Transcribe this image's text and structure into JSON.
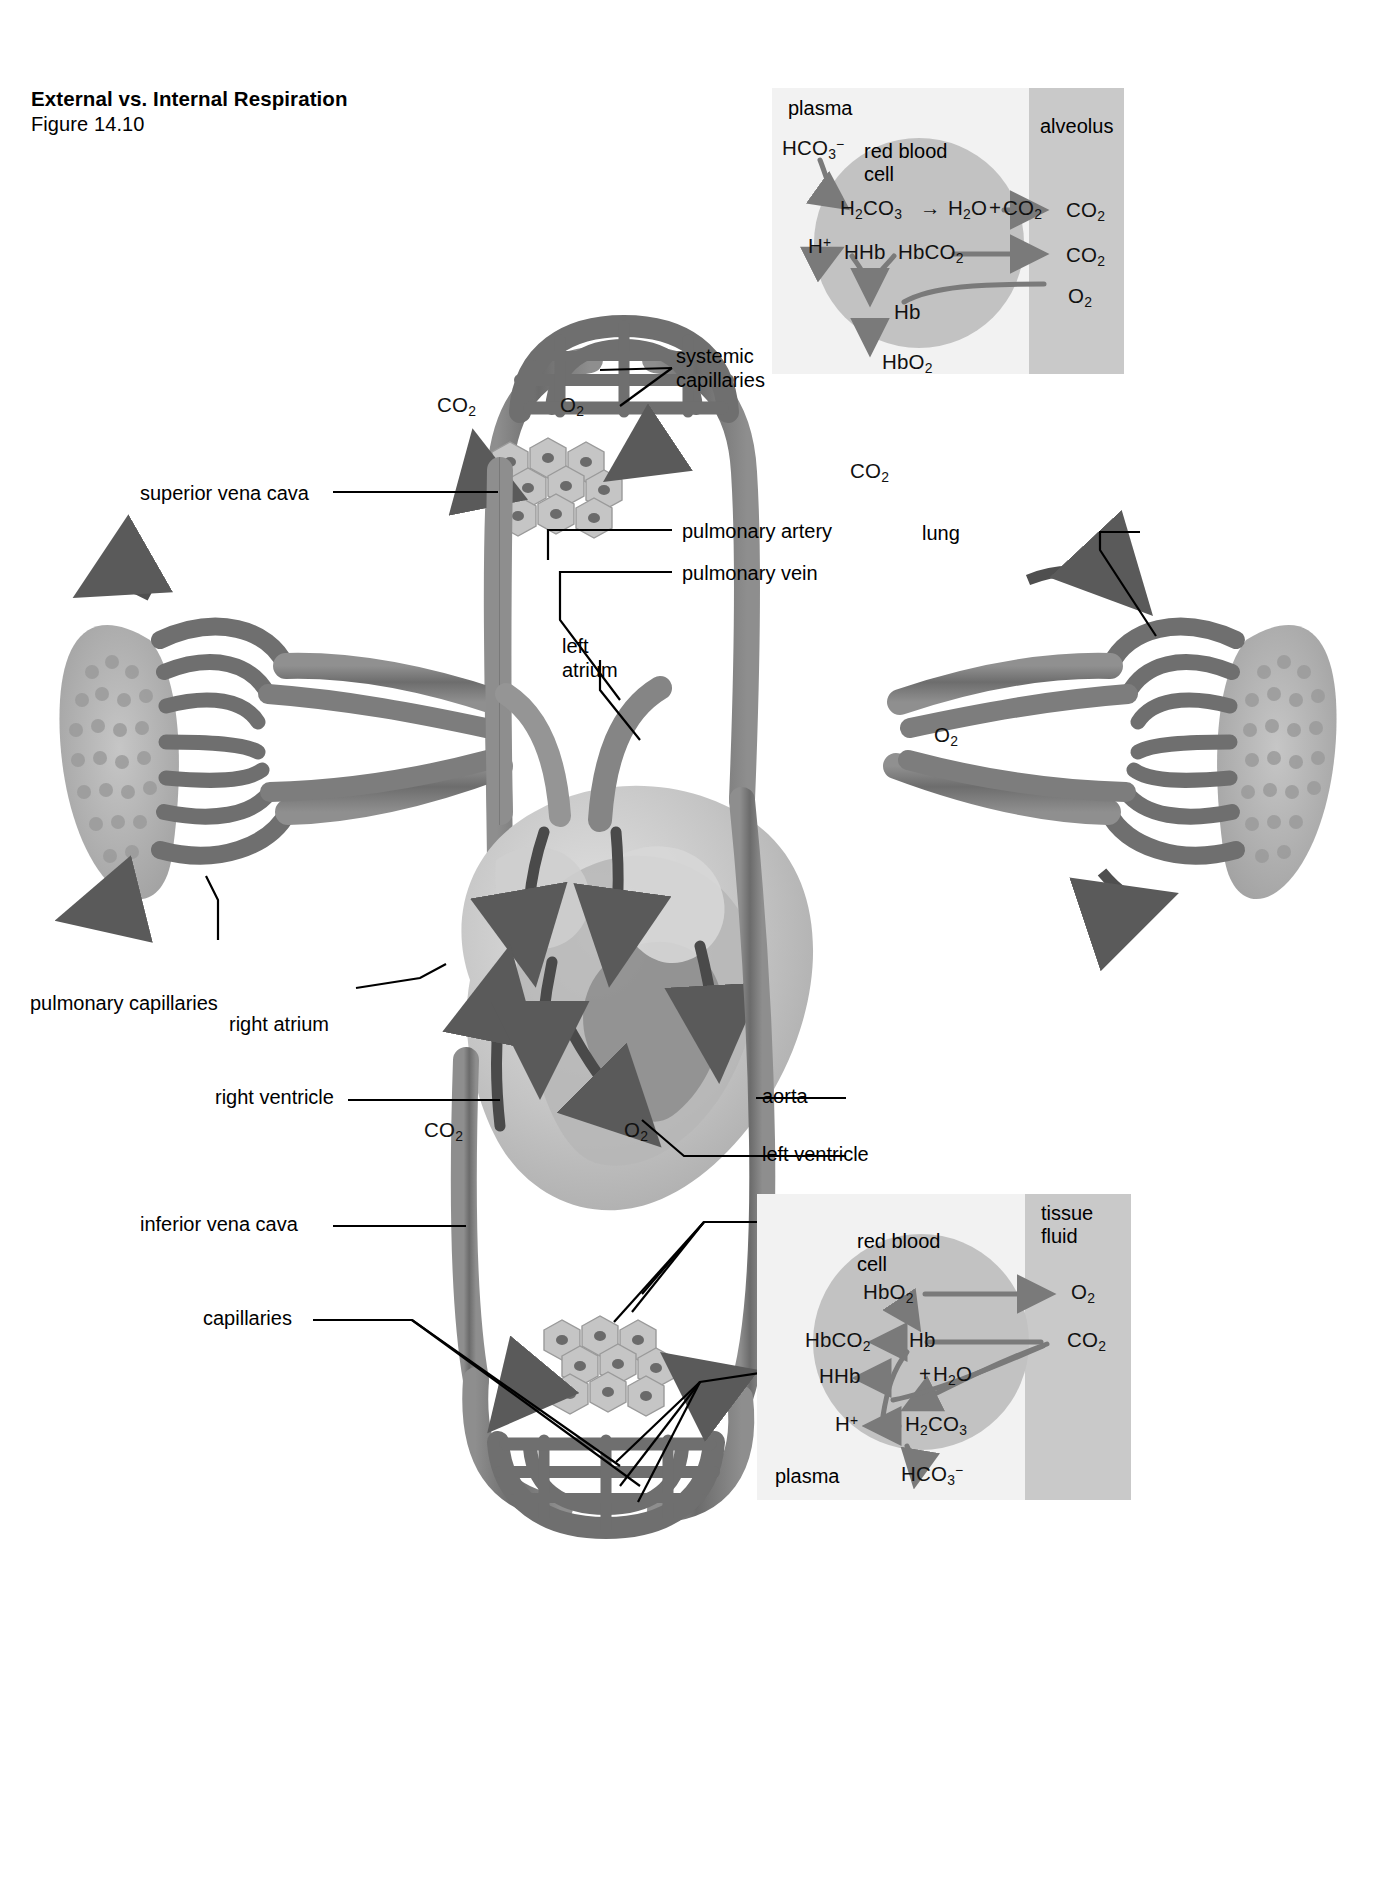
{
  "figure": {
    "title": "External vs. Internal Respiration",
    "number": "Figure 14.10"
  },
  "diagram_labels": {
    "systemic_capillaries_top": "systemic\ncapillaries",
    "systemic_capillaries_top_line1": "systemic",
    "systemic_capillaries_top_line2": "capillaries",
    "superior_vena_cava": "superior vena cava",
    "pulmonary_artery": "pulmonary artery",
    "pulmonary_vein": "pulmonary vein",
    "lung": "lung",
    "left_atrium_line1": "left",
    "left_atrium_line2": "atrium",
    "pulmonary_capillaries": "pulmonary capillaries",
    "right_atrium": "right atrium",
    "right_ventricle": "right ventricle",
    "aorta": "aorta",
    "left_ventricle": "left ventricle",
    "inferior_vena_cava": "inferior vena cava",
    "tissue_cells": "tissue cells",
    "capillaries": "capillaries",
    "systemic_capillaries_bottom_line1": "systemic",
    "systemic_capillaries_bottom_line2": "capillaries"
  },
  "gas_labels": {
    "co2_top_cells": "CO2",
    "o2_top_cells": "O2",
    "co2_right_lung": "CO2",
    "o2_right_lung": "O2",
    "co2_bottom_cells": "CO2",
    "o2_bottom_cells": "O2"
  },
  "inset_external": {
    "plasma_label": "plasma",
    "alveolus_label": "alveolus",
    "rbc_label_line1": "red blood",
    "rbc_label_line2": "cell",
    "bicarbonate": "HCO3-",
    "proton": "H+",
    "carbonic_acid": "H2CO3",
    "arrow_symbol": "→",
    "water_plus_co2": "H2O+CO2",
    "deoxyhemoglobin": "HHb",
    "carbaminohemoglobin": "HbCO2",
    "hemoglobin": "Hb",
    "oxyhemoglobin": "HbO2",
    "co2_out_upper": "CO2",
    "co2_out_lower": "CO2",
    "o2_in": "O2"
  },
  "inset_internal": {
    "plasma_label": "plasma",
    "tissue_fluid_line1": "tissue",
    "tissue_fluid_line2": "fluid",
    "rbc_label_line1": "red blood",
    "rbc_label_line2": "cell",
    "oxyhemoglobin": "HbO2",
    "carbaminohemoglobin": "HbCO2",
    "hemoglobin": "Hb",
    "deoxyhemoglobin": "HHb",
    "plus_water": "+H2O",
    "proton": "H+",
    "carbonic_acid": "H2CO3",
    "bicarbonate": "HCO3-",
    "o2_out": "O2",
    "co2_in": "CO2"
  },
  "colors": {
    "background": "#ffffff",
    "text": "#000000",
    "vessel_dark": "#6f6f6f",
    "vessel_mid": "#8a8a8a",
    "vessel_light": "#a8a8a8",
    "inset_panel": "#f2f2f2",
    "inset_fluid_band": "#c9c9c9",
    "red_blood_cell": "#c2c2c2",
    "heart_light": "#dedede",
    "heart_mid": "#b0b0b0",
    "arrow": "#555555"
  }
}
